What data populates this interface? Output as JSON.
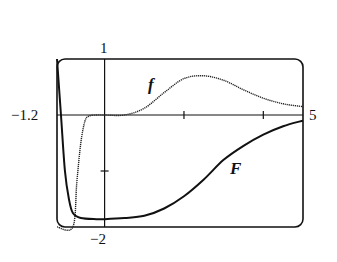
{
  "chart_data": {
    "type": "line",
    "title": "",
    "xlabel": "",
    "ylabel": "",
    "xlim": [
      -1.2,
      5
    ],
    "ylim": [
      -2,
      1
    ],
    "grid": false,
    "window_labels": {
      "xmin": "−1.2",
      "xmax": "5",
      "ymax": "1",
      "ymin": "−2"
    },
    "x_ticks": [
      2,
      4
    ],
    "y_ticks": [
      -1
    ],
    "series": [
      {
        "name": "f",
        "style": "dotted",
        "x": [
          -1.2,
          -0.8,
          -0.7,
          -0.6,
          -0.5,
          -0.4,
          -0.2,
          0,
          0.5,
          1.0,
          1.5,
          2.0,
          2.5,
          3.0,
          3.5,
          4.0,
          4.5,
          5.0
        ],
        "y": [
          -2.0,
          -2.0,
          -1.2,
          -0.5,
          -0.12,
          -0.02,
          0,
          0,
          0.0,
          0.12,
          0.4,
          0.65,
          0.7,
          0.62,
          0.45,
          0.3,
          0.2,
          0.15
        ]
      },
      {
        "name": "F",
        "style": "solid",
        "x": [
          -1.2,
          -1.1,
          -1.0,
          -0.9,
          -0.8,
          -0.6,
          -0.2,
          0,
          0.5,
          1.0,
          1.5,
          2.0,
          2.5,
          3.0,
          3.5,
          4.0,
          4.5,
          5.0
        ],
        "y": [
          1.0,
          0.0,
          -1.0,
          -1.5,
          -1.75,
          -1.84,
          -1.86,
          -1.86,
          -1.84,
          -1.8,
          -1.67,
          -1.45,
          -1.15,
          -0.8,
          -0.55,
          -0.35,
          -0.2,
          -0.1
        ]
      }
    ]
  },
  "labels": {
    "ymax": "1",
    "xmin": "−1.2",
    "xmax": "5",
    "ymin": "−2",
    "f": "f",
    "F": "F"
  }
}
